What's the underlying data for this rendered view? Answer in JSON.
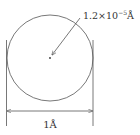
{
  "diagram": {
    "nucleus_label": {
      "base": "1.2×10",
      "exponent": "−5",
      "unit": "Å"
    },
    "diameter_label": "1Å",
    "colors": {
      "stroke": "#555555",
      "text": "#333333"
    }
  }
}
